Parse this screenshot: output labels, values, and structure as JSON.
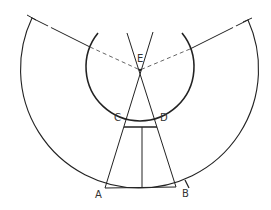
{
  "diagram": {
    "labels": {
      "A": "A",
      "B": "B",
      "C": "C",
      "D": "D",
      "E": "E"
    },
    "colors": {
      "stroke": "#222222",
      "dashed": "#666666",
      "background": "#ffffff"
    }
  }
}
